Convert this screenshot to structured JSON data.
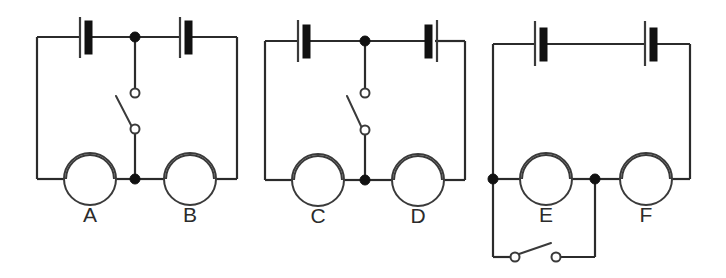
{
  "figure": {
    "background_color": "#ffffff",
    "wire_color": "#2b2b2b",
    "fill_color": "#111111",
    "label_color": "#2b2b2b"
  },
  "circuits": [
    {
      "id": "circuit-left",
      "name": "circuit-1",
      "batteries": [
        {
          "name": "battery-top-left",
          "polarity_note": "long-plate-left"
        },
        {
          "name": "battery-top-right",
          "polarity_note": "long-plate-left"
        }
      ],
      "lamps": [
        {
          "name": "lamp-a",
          "label": "A"
        },
        {
          "name": "lamp-b",
          "label": "B"
        }
      ],
      "switches": [
        {
          "name": "switch-middle-branch",
          "state": "open",
          "orientation": "vertical"
        }
      ],
      "junction_dots": 2
    },
    {
      "id": "circuit-middle",
      "name": "circuit-2",
      "batteries": [
        {
          "name": "battery-top-left",
          "polarity_note": "long-plate-left"
        },
        {
          "name": "battery-top-right",
          "polarity_note": "long-plate-right"
        }
      ],
      "lamps": [
        {
          "name": "lamp-c",
          "label": "C"
        },
        {
          "name": "lamp-d",
          "label": "D"
        }
      ],
      "switches": [
        {
          "name": "switch-middle-branch",
          "state": "open",
          "orientation": "vertical"
        }
      ],
      "junction_dots": 2
    },
    {
      "id": "circuit-right",
      "name": "circuit-3",
      "batteries": [
        {
          "name": "battery-top-left",
          "polarity_note": "long-plate-left"
        },
        {
          "name": "battery-top-right",
          "polarity_note": "long-plate-left"
        }
      ],
      "lamps": [
        {
          "name": "lamp-e",
          "label": "E"
        },
        {
          "name": "lamp-f",
          "label": "F"
        }
      ],
      "switches": [
        {
          "name": "switch-bottom-branch",
          "state": "open",
          "orientation": "horizontal"
        }
      ],
      "junction_dots": 2
    }
  ],
  "labels": {
    "a": "A",
    "b": "B",
    "c": "C",
    "d": "D",
    "e": "E",
    "f": "F"
  }
}
